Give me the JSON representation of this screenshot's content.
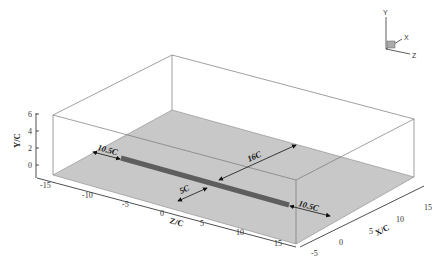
{
  "figure": {
    "colors": {
      "ground_plane": "#c8c8c8",
      "bar": "#5e5e5e",
      "box_edges": "#777777",
      "axis": "#222222"
    }
  },
  "axes": {
    "y": {
      "label": "Y/C",
      "ticks": [
        "0",
        "2",
        "4",
        "6"
      ]
    },
    "z": {
      "label": "Z/C",
      "ticks": [
        "-15",
        "-10",
        "-5",
        "0",
        "5",
        "10",
        "15"
      ]
    },
    "x": {
      "label": "X/C",
      "ticks": [
        "-5",
        "0",
        "5",
        "10",
        "15"
      ]
    }
  },
  "dimensions": {
    "left_gap": "10.5C",
    "right_gap": "10.5C",
    "to_back": "16C",
    "to_front": "5C"
  },
  "triad": {
    "y": "Y",
    "x": "X",
    "z": "Z"
  }
}
